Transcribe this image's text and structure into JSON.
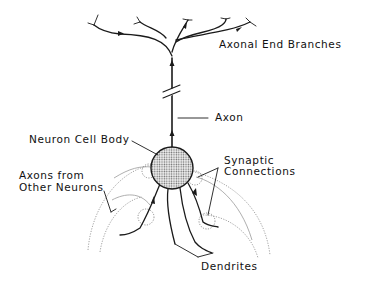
{
  "diagram": {
    "labels": {
      "axonal_end_branches": "Axonal End Branches",
      "axon": "Axon",
      "neuron_cell_body": "Neuron Cell Body",
      "synaptic_connections_line1": "Synaptic",
      "synaptic_connections_line2": "Connections",
      "axons_from_other_neurons_line1": "Axons from",
      "axons_from_other_neurons_line2": "Other Neurons",
      "dendrites": "Dendrites"
    },
    "colors": {
      "ink": "#1a1a1a",
      "cell_body_fill": "#cfcfcf",
      "dotted_axons": "#8a8a8a",
      "background": "#ffffff"
    }
  }
}
